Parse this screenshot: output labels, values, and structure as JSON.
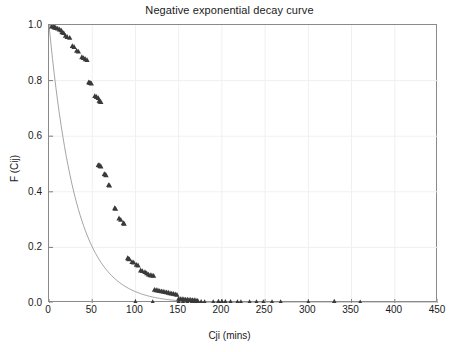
{
  "chart_data": {
    "type": "scatter",
    "title": "Negative exponential decay curve",
    "xlabel": "Cji (mins)",
    "ylabel": "F (Cij)",
    "xlim": [
      0,
      450
    ],
    "ylim": [
      0.0,
      1.0
    ],
    "grid": true,
    "legend": "none",
    "x_ticks": [
      "0",
      "50",
      "100",
      "150",
      "200",
      "250",
      "300",
      "350",
      "400",
      "450"
    ],
    "x_tick_values": [
      0,
      50,
      100,
      150,
      200,
      250,
      300,
      350,
      400,
      450
    ],
    "y_ticks": [
      "0.0",
      "0.2",
      "0.4",
      "0.6",
      "0.8",
      "1.0"
    ],
    "y_tick_values": [
      0.0,
      0.2,
      0.4,
      0.6,
      0.8,
      1.0
    ],
    "marker": "triangle",
    "marker_color": "#3a3a3a",
    "line_color": "#9a9a9a",
    "series": [
      {
        "name": "observed",
        "type": "scatter",
        "points": [
          [
            3,
            0.995
          ],
          [
            5,
            0.995
          ],
          [
            6,
            0.993
          ],
          [
            7,
            0.992
          ],
          [
            8,
            0.99
          ],
          [
            10,
            0.988
          ],
          [
            12,
            0.985
          ],
          [
            14,
            0.982
          ],
          [
            15,
            0.975
          ],
          [
            17,
            0.972
          ],
          [
            19,
            0.962
          ],
          [
            21,
            0.958
          ],
          [
            24,
            0.955
          ],
          [
            27,
            0.925
          ],
          [
            29,
            0.922
          ],
          [
            32,
            0.908
          ],
          [
            34,
            0.905
          ],
          [
            38,
            0.885
          ],
          [
            40,
            0.882
          ],
          [
            42,
            0.878
          ],
          [
            44,
            0.875
          ],
          [
            46,
            0.795
          ],
          [
            47,
            0.793
          ],
          [
            48,
            0.792
          ],
          [
            49,
            0.79
          ],
          [
            53,
            0.745
          ],
          [
            55,
            0.742
          ],
          [
            57,
            0.738
          ],
          [
            58,
            0.728
          ],
          [
            59,
            0.726
          ],
          [
            60,
            0.724
          ],
          [
            57,
            0.497
          ],
          [
            58,
            0.496
          ],
          [
            59,
            0.494
          ],
          [
            60,
            0.492
          ],
          [
            64,
            0.465
          ],
          [
            65,
            0.463
          ],
          [
            66,
            0.46
          ],
          [
            69,
            0.425
          ],
          [
            70,
            0.423
          ],
          [
            76,
            0.342
          ],
          [
            77,
            0.34
          ],
          [
            81,
            0.305
          ],
          [
            83,
            0.3
          ],
          [
            86,
            0.288
          ],
          [
            87,
            0.286
          ],
          [
            91,
            0.162
          ],
          [
            92,
            0.16
          ],
          [
            93,
            0.158
          ],
          [
            96,
            0.148
          ],
          [
            98,
            0.146
          ],
          [
            101,
            0.138
          ],
          [
            103,
            0.136
          ],
          [
            106,
            0.118
          ],
          [
            108,
            0.116
          ],
          [
            111,
            0.112
          ],
          [
            113,
            0.108
          ],
          [
            115,
            0.103
          ],
          [
            117,
            0.101
          ],
          [
            119,
            0.1
          ],
          [
            121,
            0.099
          ],
          [
            122,
            0.048
          ],
          [
            124,
            0.047
          ],
          [
            126,
            0.046
          ],
          [
            128,
            0.044
          ],
          [
            130,
            0.043
          ],
          [
            132,
            0.042
          ],
          [
            134,
            0.04
          ],
          [
            136,
            0.039
          ],
          [
            138,
            0.038
          ],
          [
            140,
            0.036
          ],
          [
            142,
            0.035
          ],
          [
            144,
            0.034
          ],
          [
            146,
            0.032
          ],
          [
            148,
            0.03
          ],
          [
            150,
            0.016
          ],
          [
            152,
            0.015
          ],
          [
            154,
            0.015
          ],
          [
            156,
            0.014
          ],
          [
            158,
            0.013
          ],
          [
            160,
            0.013
          ],
          [
            162,
            0.012
          ],
          [
            164,
            0.012
          ],
          [
            166,
            0.011
          ],
          [
            168,
            0.011
          ],
          [
            170,
            0.01
          ],
          [
            172,
            0.009
          ],
          [
            100,
            0.004
          ],
          [
            120,
            0.004
          ],
          [
            150,
            0.005
          ],
          [
            155,
            0.005
          ],
          [
            160,
            0.005
          ],
          [
            165,
            0.004
          ],
          [
            168,
            0.004
          ],
          [
            170,
            0.004
          ],
          [
            172,
            0.004
          ],
          [
            176,
            0.005
          ],
          [
            180,
            0.004
          ],
          [
            190,
            0.004
          ],
          [
            196,
            0.006
          ],
          [
            200,
            0.006
          ],
          [
            204,
            0.005
          ],
          [
            210,
            0.005
          ],
          [
            218,
            0.004
          ],
          [
            222,
            0.004
          ],
          [
            232,
            0.004
          ],
          [
            240,
            0.004
          ],
          [
            248,
            0.004
          ],
          [
            258,
            0.004
          ],
          [
            268,
            0.004
          ],
          [
            300,
            0.003
          ],
          [
            330,
            0.006
          ],
          [
            360,
            0.003
          ]
        ]
      },
      {
        "name": "fitted negative exponential",
        "type": "line",
        "equation": "F(Cji) = exp(-0.032 * Cji)",
        "decay_rate": 0.032,
        "points": [
          [
            0,
            1.0
          ],
          [
            10,
            0.726
          ],
          [
            20,
            0.527
          ],
          [
            30,
            0.383
          ],
          [
            40,
            0.278
          ],
          [
            50,
            0.202
          ],
          [
            60,
            0.147
          ],
          [
            70,
            0.107
          ],
          [
            80,
            0.078
          ],
          [
            90,
            0.056
          ],
          [
            100,
            0.041
          ],
          [
            110,
            0.03
          ],
          [
            120,
            0.022
          ],
          [
            130,
            0.016
          ],
          [
            140,
            0.011
          ],
          [
            150,
            0.008
          ],
          [
            160,
            0.006
          ],
          [
            170,
            0.004
          ],
          [
            180,
            0.003
          ],
          [
            200,
            0.002
          ],
          [
            220,
            0.001
          ],
          [
            250,
            0.0005
          ],
          [
            300,
            0.0001
          ],
          [
            350,
            0.0
          ],
          [
            450,
            0.0
          ]
        ]
      }
    ]
  }
}
